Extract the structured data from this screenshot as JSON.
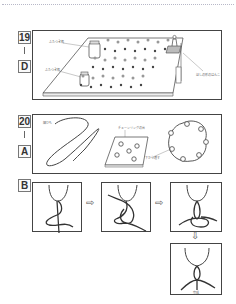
{
  "page": {
    "sections": [
      {
        "number": "19",
        "letter": "D",
        "callouts": [
          "ふたつき瓶",
          "ふたつき瓶",
          "ほしの形のはんこ"
        ]
      },
      {
        "number": "20",
        "letter": "A",
        "callouts": [
          "細ひも",
          "チェーンリングの台",
          "下から通す"
        ]
      },
      {
        "letter": "B",
        "steps": 4,
        "arrow": "⇨",
        "arrow_down": "⇩",
        "final_caption": "完成"
      }
    ]
  },
  "colors": {
    "frame": "#444444",
    "line": "#555555",
    "dotted_rule": "#b8b8c8"
  }
}
